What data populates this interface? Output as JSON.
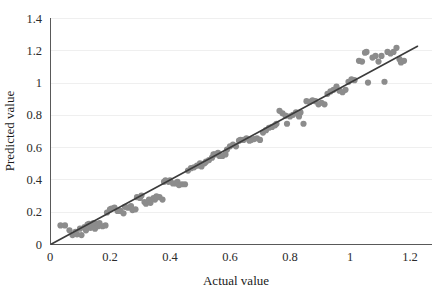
{
  "chart_data": {
    "type": "scatter",
    "title": "",
    "xlabel": "Actual value",
    "ylabel": "Predicted value",
    "xlim": [
      0,
      1.2
    ],
    "ylim": [
      0,
      1.4
    ],
    "xticks": [
      "0",
      "0.2",
      "0.4",
      "0.6",
      "0.8",
      "1",
      "1.2"
    ],
    "xtick_values": [
      0,
      0.2,
      0.4,
      0.6,
      0.8,
      1,
      1.2
    ],
    "yticks": [
      "0",
      "0.2",
      "0.4",
      "0.6",
      "0.8",
      "1",
      "1.2",
      "1.4"
    ],
    "ytick_values": [
      0,
      0.2,
      0.4,
      0.6,
      0.8,
      1,
      1.2,
      1.4
    ],
    "grid": true,
    "grid_axis": "y",
    "legend": false,
    "legend_position": "none",
    "point_color": "#8c8c8c",
    "point_radius": 3.1,
    "line_color": "#3b3b3b",
    "fit_line": {
      "type": "line",
      "x": [
        0.005,
        1.225
      ],
      "y": [
        0.0,
        1.225
      ],
      "slope": 1.0,
      "intercept": 0.0
    },
    "series": [
      {
        "name": "Predicted vs Actual",
        "points": [
          [
            0.035,
            0.115
          ],
          [
            0.05,
            0.115
          ],
          [
            0.065,
            0.085
          ],
          [
            0.075,
            0.055
          ],
          [
            0.085,
            0.075
          ],
          [
            0.09,
            0.06
          ],
          [
            0.1,
            0.095
          ],
          [
            0.105,
            0.055
          ],
          [
            0.115,
            0.105
          ],
          [
            0.12,
            0.085
          ],
          [
            0.125,
            0.12
          ],
          [
            0.13,
            0.125
          ],
          [
            0.135,
            0.1
          ],
          [
            0.14,
            0.115
          ],
          [
            0.145,
            0.13
          ],
          [
            0.15,
            0.095
          ],
          [
            0.155,
            0.125
          ],
          [
            0.16,
            0.11
          ],
          [
            0.165,
            0.13
          ],
          [
            0.175,
            0.11
          ],
          [
            0.185,
            0.115
          ],
          [
            0.19,
            0.195
          ],
          [
            0.2,
            0.215
          ],
          [
            0.205,
            0.22
          ],
          [
            0.215,
            0.225
          ],
          [
            0.225,
            0.205
          ],
          [
            0.235,
            0.205
          ],
          [
            0.245,
            0.19
          ],
          [
            0.25,
            0.23
          ],
          [
            0.26,
            0.225
          ],
          [
            0.27,
            0.235
          ],
          [
            0.275,
            0.21
          ],
          [
            0.285,
            0.215
          ],
          [
            0.29,
            0.29
          ],
          [
            0.3,
            0.285
          ],
          [
            0.305,
            0.3
          ],
          [
            0.315,
            0.26
          ],
          [
            0.32,
            0.25
          ],
          [
            0.33,
            0.275
          ],
          [
            0.335,
            0.255
          ],
          [
            0.345,
            0.285
          ],
          [
            0.35,
            0.275
          ],
          [
            0.355,
            0.295
          ],
          [
            0.365,
            0.29
          ],
          [
            0.375,
            0.275
          ],
          [
            0.38,
            0.385
          ],
          [
            0.385,
            0.395
          ],
          [
            0.395,
            0.385
          ],
          [
            0.4,
            0.395
          ],
          [
            0.41,
            0.375
          ],
          [
            0.42,
            0.375
          ],
          [
            0.425,
            0.385
          ],
          [
            0.43,
            0.365
          ],
          [
            0.44,
            0.37
          ],
          [
            0.45,
            0.37
          ],
          [
            0.46,
            0.455
          ],
          [
            0.47,
            0.47
          ],
          [
            0.48,
            0.475
          ],
          [
            0.49,
            0.485
          ],
          [
            0.5,
            0.5
          ],
          [
            0.505,
            0.48
          ],
          [
            0.515,
            0.5
          ],
          [
            0.52,
            0.51
          ],
          [
            0.53,
            0.52
          ],
          [
            0.54,
            0.535
          ],
          [
            0.545,
            0.555
          ],
          [
            0.55,
            0.555
          ],
          [
            0.56,
            0.565
          ],
          [
            0.565,
            0.545
          ],
          [
            0.575,
            0.545
          ],
          [
            0.585,
            0.555
          ],
          [
            0.59,
            0.585
          ],
          [
            0.6,
            0.605
          ],
          [
            0.61,
            0.615
          ],
          [
            0.62,
            0.605
          ],
          [
            0.63,
            0.64
          ],
          [
            0.635,
            0.645
          ],
          [
            0.645,
            0.645
          ],
          [
            0.655,
            0.655
          ],
          [
            0.665,
            0.64
          ],
          [
            0.67,
            0.645
          ],
          [
            0.68,
            0.65
          ],
          [
            0.69,
            0.655
          ],
          [
            0.7,
            0.645
          ],
          [
            0.71,
            0.69
          ],
          [
            0.72,
            0.705
          ],
          [
            0.73,
            0.72
          ],
          [
            0.74,
            0.725
          ],
          [
            0.75,
            0.735
          ],
          [
            0.755,
            0.745
          ],
          [
            0.765,
            0.825
          ],
          [
            0.775,
            0.81
          ],
          [
            0.785,
            0.795
          ],
          [
            0.79,
            0.745
          ],
          [
            0.8,
            0.79
          ],
          [
            0.81,
            0.8
          ],
          [
            0.82,
            0.815
          ],
          [
            0.83,
            0.79
          ],
          [
            0.835,
            0.815
          ],
          [
            0.845,
            0.745
          ],
          [
            0.855,
            0.885
          ],
          [
            0.865,
            0.88
          ],
          [
            0.875,
            0.89
          ],
          [
            0.885,
            0.885
          ],
          [
            0.895,
            0.865
          ],
          [
            0.905,
            0.875
          ],
          [
            0.915,
            0.865
          ],
          [
            0.925,
            0.93
          ],
          [
            0.935,
            0.945
          ],
          [
            0.945,
            0.955
          ],
          [
            0.955,
            0.975
          ],
          [
            0.965,
            0.95
          ],
          [
            0.975,
            0.94
          ],
          [
            0.985,
            0.955
          ],
          [
            0.995,
            1.005
          ],
          [
            1.005,
            1.02
          ],
          [
            1.015,
            1.015
          ],
          [
            1.03,
            1.135
          ],
          [
            1.04,
            1.13
          ],
          [
            1.05,
            1.185
          ],
          [
            1.055,
            1.19
          ],
          [
            1.06,
            1.0
          ],
          [
            1.075,
            1.155
          ],
          [
            1.085,
            1.165
          ],
          [
            1.095,
            1.13
          ],
          [
            1.105,
            1.165
          ],
          [
            1.115,
            1.005
          ],
          [
            1.125,
            1.19
          ],
          [
            1.135,
            1.18
          ],
          [
            1.145,
            1.19
          ],
          [
            1.155,
            1.215
          ],
          [
            1.165,
            1.145
          ],
          [
            1.17,
            1.125
          ],
          [
            1.18,
            1.135
          ]
        ]
      }
    ]
  }
}
